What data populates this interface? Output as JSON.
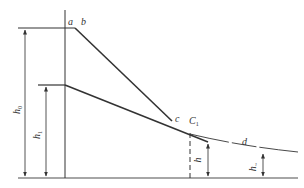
{
  "diagram": {
    "type": "water-surface-profile",
    "labels": {
      "a": "a",
      "b": "b",
      "c": "c",
      "C1": "C",
      "C1_sub": "1",
      "d": "d",
      "h0": "h",
      "h0_sub": "0",
      "h1": "h",
      "h1_sub": "1",
      "h": "h",
      "hn": "h",
      "hn_sub": "~"
    },
    "colors": {
      "line": "#333333",
      "baseline": "#888888",
      "text": "#333333"
    }
  }
}
